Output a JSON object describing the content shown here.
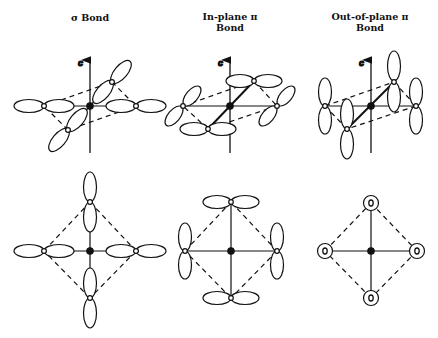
{
  "columns": [
    {
      "id": "sigma",
      "title_line1": "σ Bond",
      "title_line2": ""
    },
    {
      "id": "inplane-pi",
      "title_line1": "In-plane π",
      "title_line2": "Bond"
    },
    {
      "id": "outofplane-pi",
      "title_line1": "Out-of-plane π",
      "title_line2": "Bond"
    }
  ],
  "axis_label": "c",
  "colors": {
    "line": "#111111",
    "background": "#ffffff"
  }
}
